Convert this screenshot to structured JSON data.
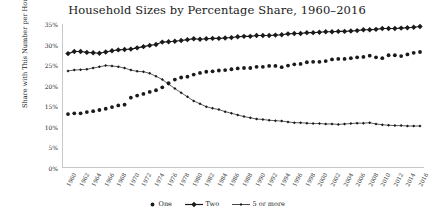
{
  "chart_data": {
    "type": "line",
    "title": "Household Sizes by Percentage Share, 1960–2016",
    "xlabel": "",
    "ylabel": "Share with This Number per Household",
    "ylim": [
      0,
      35
    ],
    "xlim": [
      1960,
      2016
    ],
    "grid": false,
    "legend_position": "bottom-center",
    "ytick_labels": [
      "0%",
      "5%",
      "10%",
      "15%",
      "20%",
      "25%",
      "30%",
      "35%"
    ],
    "ytick_values": [
      0,
      5,
      10,
      15,
      20,
      25,
      30,
      35
    ],
    "xtick_labels": [
      "1960",
      "1962",
      "1964",
      "1966",
      "1968",
      "1970",
      "1972",
      "1974",
      "1976",
      "1978",
      "1980",
      "1982",
      "1984",
      "1986",
      "1988",
      "1990",
      "1992",
      "1994",
      "1996",
      "1998",
      "2000",
      "2002",
      "2004",
      "2006",
      "2008",
      "2010",
      "2012",
      "2014",
      "2016"
    ],
    "x": [
      1960,
      1961,
      1962,
      1963,
      1964,
      1965,
      1966,
      1967,
      1968,
      1969,
      1970,
      1971,
      1972,
      1973,
      1974,
      1975,
      1976,
      1977,
      1978,
      1979,
      1980,
      1981,
      1982,
      1983,
      1984,
      1985,
      1986,
      1987,
      1988,
      1989,
      1990,
      1991,
      1992,
      1993,
      1994,
      1995,
      1996,
      1997,
      1998,
      1999,
      2000,
      2001,
      2002,
      2003,
      2004,
      2005,
      2006,
      2007,
      2008,
      2009,
      2010,
      2011,
      2012,
      2013,
      2014,
      2015,
      2016
    ],
    "series": [
      {
        "name": "One",
        "color": "#1a1a1a",
        "marker": "circle",
        "linestyle": "none",
        "values": [
          13.1,
          13.3,
          13.3,
          13.6,
          13.8,
          14.1,
          14.4,
          14.8,
          15.2,
          15.4,
          17.1,
          17.6,
          18.0,
          18.5,
          18.9,
          19.6,
          20.6,
          21.5,
          22.0,
          22.2,
          22.7,
          23.1,
          23.4,
          23.5,
          23.7,
          23.8,
          24.0,
          24.2,
          24.3,
          24.3,
          24.6,
          24.6,
          24.8,
          24.8,
          24.5,
          24.9,
          25.2,
          25.3,
          25.7,
          25.8,
          25.8,
          26.0,
          26.4,
          26.5,
          26.5,
          26.7,
          26.9,
          27.0,
          27.3,
          26.9,
          26.7,
          27.4,
          27.4,
          27.2,
          27.6,
          28.0,
          28.2
        ]
      },
      {
        "name": "Two",
        "color": "#1a1a1a",
        "marker": "diamond",
        "linestyle": "solid",
        "values": [
          27.8,
          28.3,
          28.3,
          28.1,
          28.0,
          27.9,
          28.2,
          28.5,
          28.7,
          28.8,
          28.9,
          29.2,
          29.5,
          29.8,
          30.0,
          30.6,
          30.7,
          30.8,
          31.0,
          31.2,
          31.4,
          31.3,
          31.4,
          31.5,
          31.5,
          31.6,
          31.7,
          31.9,
          32.0,
          32.0,
          32.2,
          32.2,
          32.2,
          32.3,
          32.4,
          32.6,
          32.7,
          32.7,
          32.9,
          32.9,
          33.0,
          33.1,
          33.1,
          33.2,
          33.2,
          33.3,
          33.4,
          33.6,
          33.6,
          33.7,
          33.9,
          33.9,
          33.9,
          34.0,
          34.1,
          34.2,
          34.4
        ]
      },
      {
        "name": "5 or more",
        "color": "#1a1a1a",
        "marker": "small-diamond",
        "linestyle": "solid",
        "values": [
          23.6,
          23.8,
          23.9,
          24.0,
          24.3,
          24.6,
          24.9,
          24.8,
          24.6,
          24.3,
          23.8,
          23.5,
          23.4,
          23.0,
          22.3,
          21.5,
          20.4,
          19.3,
          18.3,
          17.3,
          16.3,
          15.6,
          14.9,
          14.5,
          14.2,
          13.7,
          13.3,
          12.9,
          12.5,
          12.2,
          11.9,
          11.8,
          11.6,
          11.5,
          11.4,
          11.2,
          11.0,
          11.0,
          10.9,
          10.8,
          10.8,
          10.7,
          10.7,
          10.6,
          10.7,
          10.8,
          10.9,
          10.9,
          11.0,
          10.7,
          10.5,
          10.4,
          10.3,
          10.3,
          10.2,
          10.2,
          10.2
        ]
      }
    ]
  }
}
